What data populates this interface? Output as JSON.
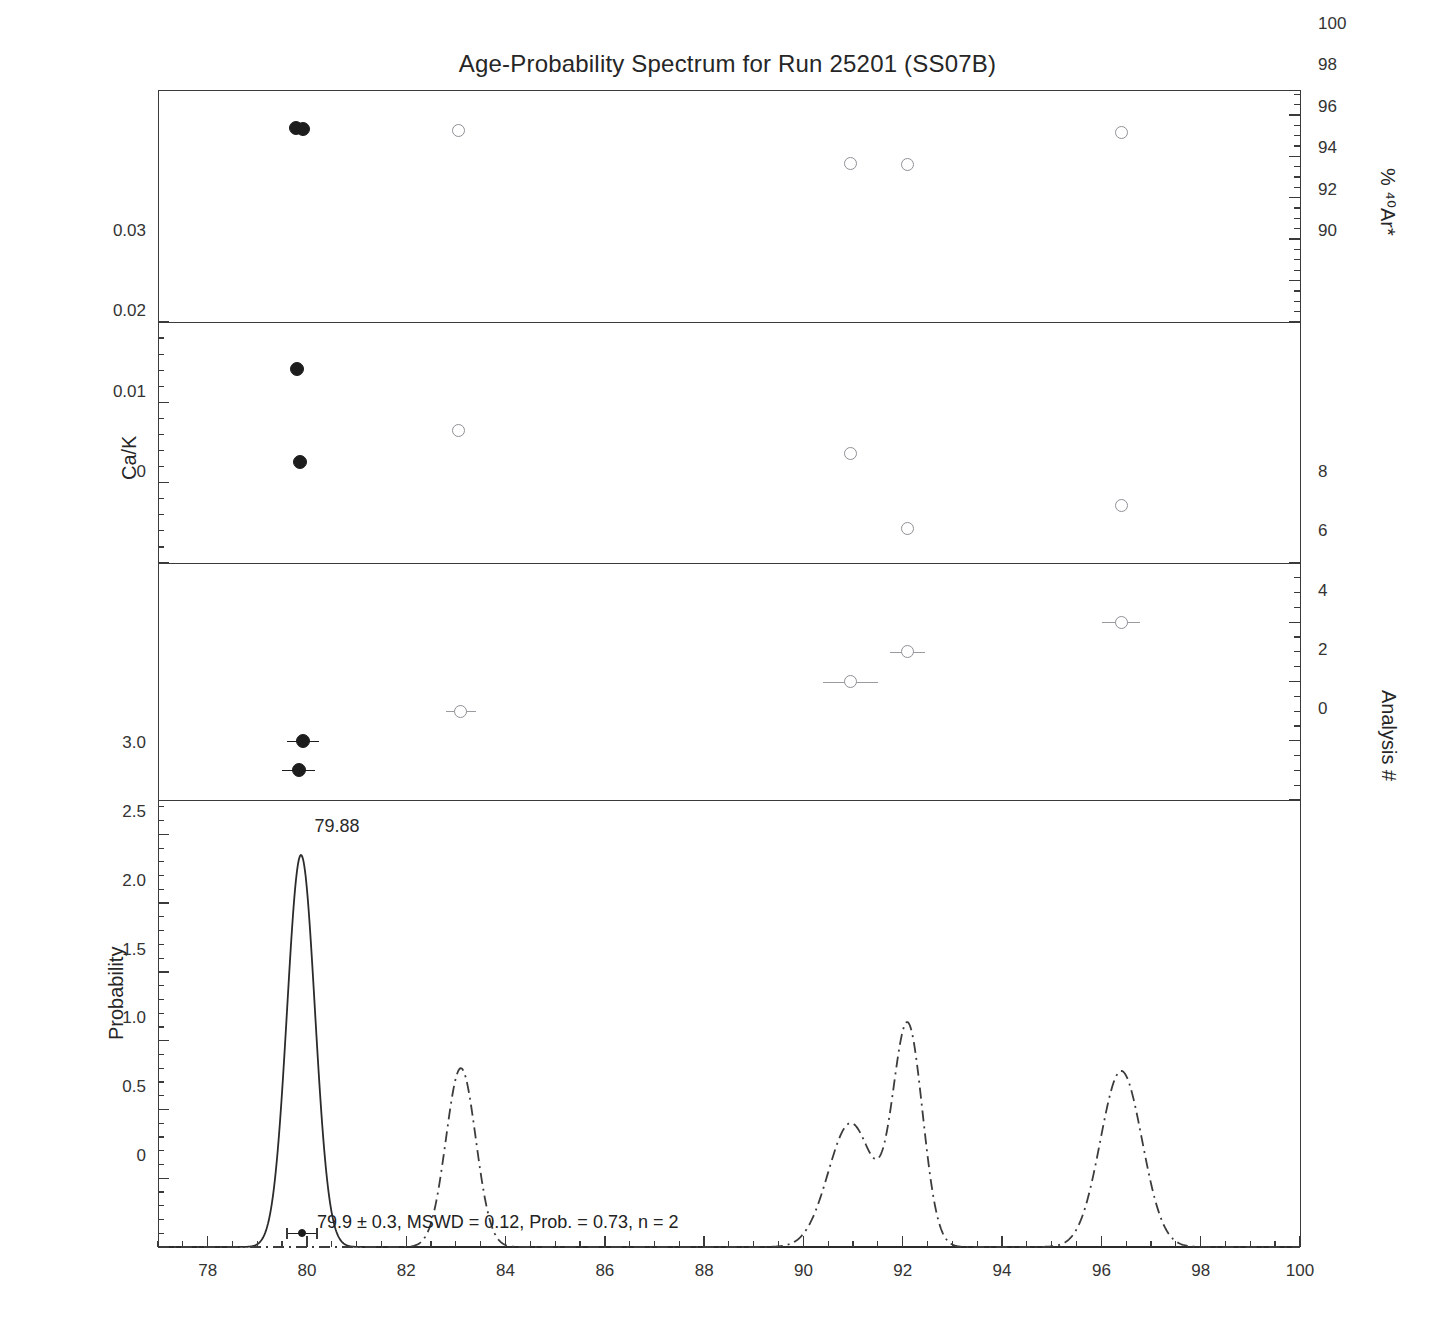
{
  "chart_data": {
    "type": "scatter",
    "title": "Age-Probability Spectrum for Run 25201 (SS07B)",
    "xlabel": "",
    "xlim": [
      77,
      100
    ],
    "x_ticks": [
      78,
      80,
      82,
      84,
      86,
      88,
      90,
      92,
      94,
      96,
      98,
      100
    ],
    "x_tick_labels": [
      "78",
      "80",
      "82",
      "84",
      "86",
      "88",
      "90",
      "92",
      "94",
      "96",
      "98",
      "100"
    ],
    "x_minor_step": 0.5,
    "grid": false,
    "legend": "none",
    "panels": [
      {
        "id": "ar40-panel",
        "ylabel": "% ⁴⁰Ar*",
        "ylabel_side": "right",
        "ylim": [
          90,
          101.2
        ],
        "y_ticks": [
          90,
          92,
          94,
          96,
          98,
          100
        ],
        "y_tick_labels": [
          "90",
          "92",
          "94",
          "96",
          "98",
          "100"
        ],
        "y_minor_step": 0.5,
        "series": [
          {
            "name": "included",
            "marker": "filled-circle",
            "points": [
              {
                "x": 79.78,
                "y": 99.35
              },
              {
                "x": 79.92,
                "y": 99.3
              }
            ]
          },
          {
            "name": "excluded",
            "marker": "open-circle",
            "points": [
              {
                "x": 83.05,
                "y": 99.25
              },
              {
                "x": 90.95,
                "y": 97.65
              },
              {
                "x": 92.1,
                "y": 97.6
              },
              {
                "x": 96.4,
                "y": 99.15
              }
            ]
          }
        ]
      },
      {
        "id": "cak-panel",
        "ylabel": "Ca/K",
        "ylabel_side": "left",
        "ylim": [
          0,
          0.03
        ],
        "y_ticks": [
          0,
          0.01,
          0.02,
          0.03
        ],
        "y_tick_labels": [
          "0",
          "0.01",
          "0.02",
          "0.03"
        ],
        "y_minor_step": 0.002,
        "series": [
          {
            "name": "included",
            "marker": "filled-circle",
            "points": [
              {
                "x": 79.8,
                "y": 0.0241
              },
              {
                "x": 79.85,
                "y": 0.0126
              }
            ]
          },
          {
            "name": "excluded",
            "marker": "open-circle",
            "points": [
              {
                "x": 83.05,
                "y": 0.0165
              },
              {
                "x": 90.95,
                "y": 0.0136
              },
              {
                "x": 92.1,
                "y": 0.0043
              },
              {
                "x": 96.4,
                "y": 0.0072
              }
            ]
          }
        ]
      },
      {
        "id": "analysis-panel",
        "ylabel": "Analysis #",
        "ylabel_side": "right",
        "ylim": [
          0,
          8
        ],
        "y_ticks": [
          0,
          2,
          4,
          6,
          8
        ],
        "y_tick_labels": [
          "0",
          "2",
          "4",
          "6",
          "8"
        ],
        "y_minor_step": 0.5,
        "series": [
          {
            "name": "included",
            "marker": "filled-circle-errorbar",
            "points": [
              {
                "x": 79.83,
                "y": 1,
                "xerr": 0.33
              },
              {
                "x": 79.92,
                "y": 2,
                "xerr": 0.33
              }
            ]
          },
          {
            "name": "excluded",
            "marker": "open-circle-errorbar",
            "points": [
              {
                "x": 83.1,
                "y": 3,
                "xerr": 0.3
              },
              {
                "x": 90.95,
                "y": 4,
                "xerr": 0.55
              },
              {
                "x": 92.1,
                "y": 5,
                "xerr": 0.35
              },
              {
                "x": 96.4,
                "y": 6,
                "xerr": 0.38
              }
            ]
          }
        ]
      },
      {
        "id": "probability-panel",
        "ylabel": "Probability",
        "ylabel_side": "left",
        "ylim": [
          0,
          3.25
        ],
        "y_ticks": [
          0,
          0.5,
          1.0,
          1.5,
          2.0,
          2.5,
          3.0
        ],
        "y_tick_labels": [
          "0",
          "0.5",
          "1.0",
          "1.5",
          "2.0",
          "2.5",
          "3.0"
        ],
        "y_minor_step": 0.1,
        "curves": [
          {
            "name": "included-probability",
            "style": "solid",
            "peaks": [
              {
                "center": 79.88,
                "height": 2.85,
                "sigma": 0.28
              }
            ]
          },
          {
            "name": "all-probability",
            "style": "dash-dot",
            "peaks": [
              {
                "center": 83.1,
                "height": 1.3,
                "sigma": 0.3
              },
              {
                "center": 90.95,
                "height": 0.9,
                "sigma": 0.45
              },
              {
                "center": 92.1,
                "height": 1.6,
                "sigma": 0.3
              },
              {
                "center": 96.4,
                "height": 1.28,
                "sigma": 0.42
              }
            ]
          }
        ],
        "peak_label": {
          "text": "79.88",
          "x": 80.15,
          "y": 3.05
        },
        "mean_errorbar": {
          "x": 79.9,
          "xerr": 0.3,
          "y": 0.1
        },
        "annotation": {
          "text": "79.9 ± 0.3, MSWD = 0.12, Prob. = 0.73, n = 2",
          "x": 80.2,
          "y": 0.17
        }
      }
    ]
  },
  "labels": {
    "title": "Age-Probability Spectrum for Run 25201 (SS07B)",
    "ar40_axis": "% ⁴⁰Ar*",
    "cak_axis": "Ca/K",
    "analysis_axis": "Analysis #",
    "probability_axis": "Probability",
    "peak_label": "79.88",
    "stats_annotation": "79.9 ± 0.3, MSWD = 0.12, Prob. = 0.73, n = 2"
  },
  "colors": {
    "frame": "#3a3a3a",
    "included_marker": "#1d1d1d",
    "excluded_marker": "#8f8f96",
    "curve_included": "#2b2b2b",
    "curve_excluded": "#3c3c3c",
    "text": "#262626",
    "background": "#ffffff"
  }
}
